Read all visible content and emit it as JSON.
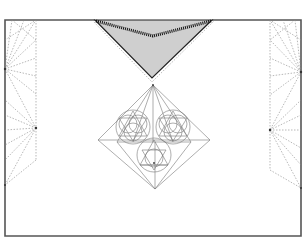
{
  "diagram": {
    "colors": {
      "background": "#ffffff",
      "frame": "#555555",
      "neck_fill": "#cfcfcf",
      "stitch": "#111111",
      "construction_lines": "#777777",
      "dashed_lines": "#888888"
    },
    "frame": {
      "x": 5,
      "y": 20,
      "width": 296,
      "height": 216
    },
    "neckline": {
      "left": [
        95,
        20
      ],
      "right": [
        212,
        20
      ],
      "mid_top": [
        153,
        35
      ],
      "tip": [
        152,
        78
      ]
    },
    "motif": {
      "type": "diamond",
      "top": [
        153,
        85
      ],
      "left": [
        98,
        140
      ],
      "right": [
        210,
        140
      ],
      "bottom": [
        155,
        189
      ],
      "circles": [
        {
          "cx": 133,
          "cy": 127,
          "r": 17
        },
        {
          "cx": 173,
          "cy": 127,
          "r": 17
        },
        {
          "cx": 154,
          "cy": 155,
          "r": 17
        }
      ]
    },
    "side_panels": [
      "left-dashed-fan",
      "right-dashed-fan"
    ]
  }
}
